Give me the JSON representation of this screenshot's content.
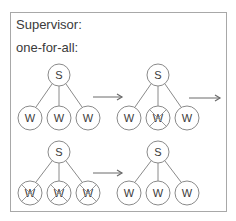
{
  "title": "Supervisor:",
  "strategy": "one-for-all:",
  "colors": {
    "stroke": "#8a8a8a",
    "text": "#3a3a3a",
    "frame": "#a8a8a8",
    "cross": "#9a9a9a"
  },
  "node_labels": {
    "supervisor": "S",
    "worker": "W"
  },
  "stages": [
    {
      "name": "initial",
      "supervisor": {
        "label": "S"
      },
      "workers": [
        {
          "label": "W",
          "crossed": false
        },
        {
          "label": "W",
          "crossed": false
        },
        {
          "label": "W",
          "crossed": false
        }
      ]
    },
    {
      "name": "one-worker-fails",
      "supervisor": {
        "label": "S"
      },
      "workers": [
        {
          "label": "W",
          "crossed": false
        },
        {
          "label": "W",
          "crossed": true
        },
        {
          "label": "W",
          "crossed": false
        }
      ]
    },
    {
      "name": "all-workers-terminated",
      "supervisor": {
        "label": "S"
      },
      "workers": [
        {
          "label": "W",
          "crossed": true
        },
        {
          "label": "W",
          "crossed": true
        },
        {
          "label": "W",
          "crossed": true
        }
      ]
    },
    {
      "name": "all-workers-restarted",
      "supervisor": {
        "label": "S"
      },
      "workers": [
        {
          "label": "W",
          "crossed": false
        },
        {
          "label": "W",
          "crossed": false
        },
        {
          "label": "W",
          "crossed": false
        }
      ]
    }
  ],
  "arrows": [
    {
      "from": "initial",
      "to": "one-worker-fails"
    },
    {
      "from": "one-worker-fails",
      "to": "all-workers-terminated"
    },
    {
      "from": "all-workers-terminated",
      "to": "all-workers-restarted"
    }
  ]
}
